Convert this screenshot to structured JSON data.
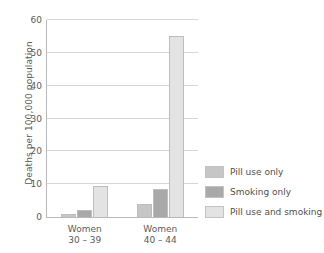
{
  "chart_data": {
    "type": "bar",
    "title": "",
    "xlabel": "",
    "ylabel": "Deaths per 100,000 population",
    "categories": [
      "Women\n30 – 39",
      "Women\n40 – 44"
    ],
    "category_labels": [
      {
        "line1": "Women",
        "line2": "30 – 39"
      },
      {
        "line1": "Women",
        "line2": "40 – 44"
      }
    ],
    "series": [
      {
        "name": "Pill use only",
        "values": [
          1,
          4
        ],
        "color": "#c6c6c6"
      },
      {
        "name": "Smoking only",
        "values": [
          2,
          8.5
        ],
        "color": "#a9a9a9"
      },
      {
        "name": "Pill use and smoking",
        "values": [
          9.5,
          55
        ],
        "color": "#e3e3e3"
      }
    ],
    "ylim": [
      0,
      60
    ],
    "yticks": [
      0,
      10,
      20,
      30,
      40,
      50,
      60
    ],
    "ytick_labels": [
      "0",
      "10",
      "20",
      "30",
      "40",
      "50",
      "60"
    ],
    "grid": "horizontal",
    "legend_position": "right",
    "background_color": "#ffffff",
    "axis_color": "#b9b9b9",
    "gridline_color": "#d6d6d6"
  }
}
